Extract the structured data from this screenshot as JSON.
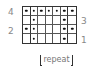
{
  "chart": {
    "type": "stitch-chart",
    "columns": 7,
    "rows": 4,
    "thick_after_columns": [
      1,
      6
    ],
    "cells": [
      [
        1,
        1,
        1,
        1,
        1,
        1,
        1
      ],
      [
        0,
        1,
        0,
        0,
        0,
        1,
        0
      ],
      [
        1,
        1,
        0,
        0,
        0,
        1,
        1
      ],
      [
        0,
        1,
        0,
        0,
        0,
        1,
        0
      ]
    ]
  },
  "row_labels": {
    "left": [
      {
        "text": "4",
        "row": 0
      },
      {
        "text": "2",
        "row": 2
      }
    ],
    "right": [
      {
        "text": "3",
        "row": 1
      },
      {
        "text": "1",
        "row": 3
      }
    ]
  },
  "repeat_label": "repeat"
}
